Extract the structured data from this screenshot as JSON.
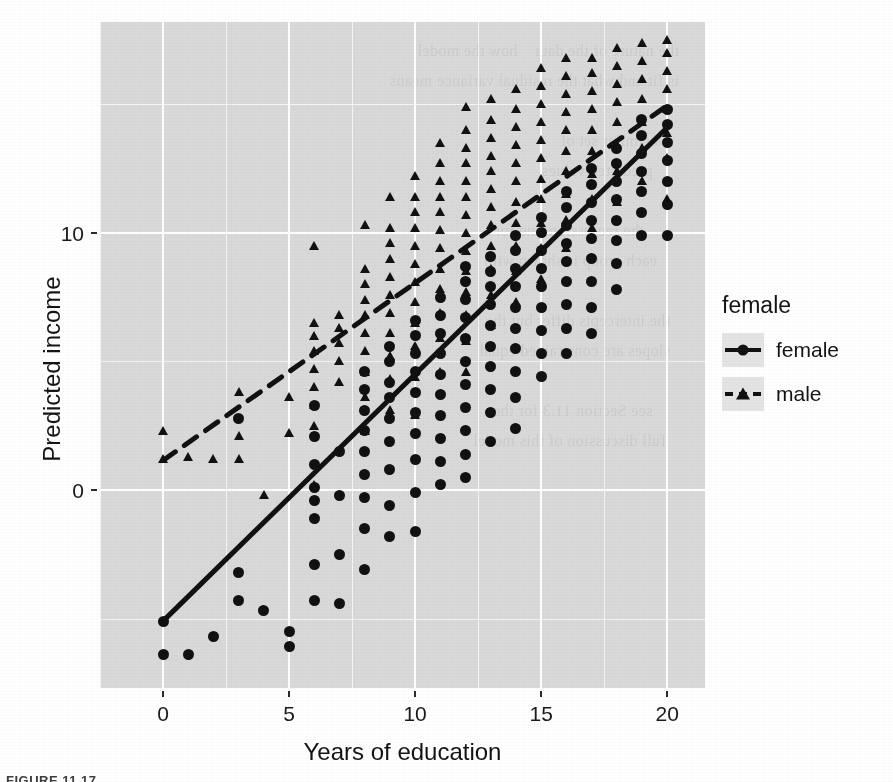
{
  "figure": {
    "caption": "FIGURE 11.17"
  },
  "axes": {
    "x": {
      "label": "Years of education",
      "ticks": [
        0,
        5,
        10,
        15,
        20
      ],
      "tick_labels": [
        "0",
        "5",
        "10",
        "15",
        "20"
      ],
      "range": [
        -2.5,
        21.5
      ],
      "minor_ticks": [
        -2.5,
        2.5,
        7.5,
        12.5,
        17.5
      ]
    },
    "y": {
      "label": "Predicted income",
      "ticks": [
        0,
        10
      ],
      "tick_labels": [
        "0",
        "10"
      ],
      "range": [
        -7.7,
        18.2
      ],
      "minor_ticks": [
        -5,
        5,
        15
      ]
    }
  },
  "legend": {
    "title": "female",
    "position": "right",
    "entries": [
      {
        "label": "female",
        "shape": "circle-icon",
        "line": "solid",
        "color": "#111111"
      },
      {
        "label": "male",
        "shape": "triangle-icon",
        "line": "dashed",
        "color": "#111111"
      }
    ]
  },
  "panel": {
    "background": "#d9d9d9",
    "gridline_color": "#ffffff",
    "bleed_text": "the nature of the data    how the model\nis fit and what the residual variance means\n\n    a similar set of\n      predicted values\n\n        the regression line for\n     each group is shown with\n\n  the intercepts differ but the\n  slopes are constrained equal\n\n      see Section 11.3 for the\n   full discussion of this model"
  },
  "chart_data": {
    "type": "scatter",
    "title": "",
    "xlabel": "Years of education",
    "ylabel": "Predicted income",
    "xlim": [
      -2.5,
      21.5
    ],
    "ylim": [
      -7.7,
      18.2
    ],
    "grid": true,
    "legend_title": "female",
    "legend_position": "right",
    "series": [
      {
        "name": "female",
        "marker": "circle",
        "line": "solid",
        "fit_line": {
          "intercept": -5.1,
          "slope": 0.96,
          "x_from": 0,
          "x_to": 20
        },
        "points_by_x": [
          {
            "x": 0,
            "values": [
              -6.4,
              -5.1
            ]
          },
          {
            "x": 1,
            "values": [
              -6.4
            ]
          },
          {
            "x": 2,
            "values": [
              -5.7
            ]
          },
          {
            "x": 3,
            "values": [
              -4.3,
              -3.2,
              2.8
            ]
          },
          {
            "x": 4,
            "values": [
              -4.7
            ]
          },
          {
            "x": 5,
            "values": [
              -6.1,
              -5.5
            ]
          },
          {
            "x": 6,
            "values": [
              -4.3,
              -2.9,
              -1.1,
              -0.4,
              0.1,
              1.0,
              2.1,
              3.3
            ]
          },
          {
            "x": 7,
            "values": [
              -4.4,
              -2.5,
              -0.2,
              1.5
            ]
          },
          {
            "x": 8,
            "values": [
              -3.1,
              -1.5,
              -0.3,
              0.6,
              1.5,
              2.3,
              3.1,
              3.9,
              4.6
            ]
          },
          {
            "x": 9,
            "values": [
              -1.8,
              -0.6,
              0.8,
              1.9,
              2.8,
              3.6,
              4.2,
              5.0,
              5.6
            ]
          },
          {
            "x": 10,
            "values": [
              -1.6,
              -0.1,
              1.2,
              2.2,
              3.0,
              3.8,
              4.6,
              5.3,
              6.0,
              6.6
            ]
          },
          {
            "x": 11,
            "values": [
              0.2,
              1.1,
              2.0,
              2.9,
              3.7,
              4.5,
              5.3,
              6.1,
              6.8,
              7.5
            ]
          },
          {
            "x": 12,
            "values": [
              0.5,
              1.4,
              2.3,
              3.2,
              4.1,
              5.0,
              5.9,
              6.7,
              7.4,
              8.1,
              8.7
            ]
          },
          {
            "x": 13,
            "values": [
              1.9,
              3.0,
              3.9,
              4.8,
              5.6,
              6.4,
              7.2,
              7.9,
              8.5,
              9.1
            ]
          },
          {
            "x": 14,
            "values": [
              2.4,
              3.6,
              4.6,
              5.5,
              6.3,
              7.1,
              7.9,
              8.6,
              9.3,
              9.9
            ]
          },
          {
            "x": 15,
            "values": [
              4.4,
              5.3,
              6.2,
              7.1,
              7.9,
              8.6,
              9.3,
              10.0,
              10.6
            ]
          },
          {
            "x": 16,
            "values": [
              5.3,
              6.3,
              7.2,
              8.1,
              8.9,
              9.6,
              10.3,
              11.0,
              11.6
            ]
          },
          {
            "x": 17,
            "values": [
              6.1,
              7.1,
              8.1,
              9.0,
              9.8,
              10.5,
              11.2,
              11.9,
              12.5
            ]
          },
          {
            "x": 18,
            "values": [
              7.8,
              8.8,
              9.7,
              10.5,
              11.3,
              12.0,
              12.7,
              13.3
            ]
          },
          {
            "x": 19,
            "values": [
              9.9,
              10.8,
              11.6,
              12.4,
              13.1,
              13.8,
              14.4
            ]
          },
          {
            "x": 20,
            "values": [
              9.9,
              11.1,
              12.0,
              12.8,
              13.5,
              14.2,
              14.8
            ]
          }
        ]
      },
      {
        "name": "male",
        "marker": "triangle",
        "line": "dashed",
        "fit_line": {
          "intercept": 1.15,
          "slope": 0.69,
          "x_from": 0,
          "x_to": 20
        },
        "points_by_x": [
          {
            "x": 0,
            "values": [
              1.2,
              2.3
            ]
          },
          {
            "x": 1,
            "values": [
              1.3
            ]
          },
          {
            "x": 2,
            "values": [
              1.2
            ]
          },
          {
            "x": 3,
            "values": [
              1.2,
              2.1,
              3.8
            ]
          },
          {
            "x": 4,
            "values": [
              -0.2
            ]
          },
          {
            "x": 5,
            "values": [
              2.2,
              3.6
            ]
          },
          {
            "x": 6,
            "values": [
              0.2,
              2.5,
              3.3,
              4.0,
              4.7,
              5.4,
              6.0,
              6.5,
              9.5
            ]
          },
          {
            "x": 7,
            "values": [
              4.2,
              5.0,
              5.7,
              6.3,
              6.8
            ]
          },
          {
            "x": 8,
            "values": [
              2.3,
              3.6,
              4.6,
              5.4,
              6.1,
              6.8,
              7.4,
              8.0,
              8.6,
              10.3
            ]
          },
          {
            "x": 9,
            "values": [
              3.1,
              4.3,
              5.2,
              6.1,
              6.9,
              7.6,
              8.3,
              9.0,
              9.6,
              10.2,
              11.4
            ]
          },
          {
            "x": 10,
            "values": [
              2.9,
              4.4,
              5.6,
              6.5,
              7.3,
              8.1,
              8.8,
              9.5,
              10.2,
              10.8,
              11.4,
              12.2
            ]
          },
          {
            "x": 11,
            "values": [
              4.6,
              5.9,
              6.9,
              7.8,
              8.6,
              9.4,
              10.1,
              10.8,
              11.4,
              12.0,
              12.7,
              13.5
            ]
          },
          {
            "x": 12,
            "values": [
              4.6,
              5.8,
              6.8,
              7.7,
              8.5,
              9.3,
              10.0,
              10.7,
              11.4,
              12.0,
              12.7,
              13.3,
              14.0,
              14.9
            ]
          },
          {
            "x": 13,
            "values": [
              6.4,
              7.6,
              8.6,
              9.5,
              10.3,
              11.0,
              11.7,
              12.4,
              13.0,
              13.7,
              14.4,
              15.2
            ]
          },
          {
            "x": 14,
            "values": [
              7.3,
              8.5,
              9.5,
              10.4,
              11.2,
              12.0,
              12.7,
              13.4,
              14.1,
              14.8,
              15.6
            ]
          },
          {
            "x": 15,
            "values": [
              8.2,
              9.4,
              10.4,
              11.3,
              12.1,
              12.9,
              13.6,
              14.3,
              15.0,
              15.7,
              16.4
            ]
          },
          {
            "x": 16,
            "values": [
              9.4,
              10.5,
              11.5,
              12.4,
              13.2,
              14.0,
              14.7,
              15.4,
              16.1,
              16.8
            ]
          },
          {
            "x": 17,
            "values": [
              10.2,
              11.3,
              12.3,
              13.2,
              14.0,
              14.8,
              15.5,
              16.2,
              16.8
            ]
          },
          {
            "x": 18,
            "values": [
              11.2,
              12.4,
              13.4,
              14.3,
              15.1,
              15.8,
              16.5,
              17.2
            ]
          },
          {
            "x": 19,
            "values": [
              12.0,
              13.3,
              14.3,
              15.2,
              16.0,
              16.7,
              17.4
            ]
          },
          {
            "x": 20,
            "values": [
              11.3,
              12.9,
              13.9,
              14.8,
              15.6,
              16.3,
              17.0,
              17.5
            ]
          }
        ]
      }
    ]
  }
}
